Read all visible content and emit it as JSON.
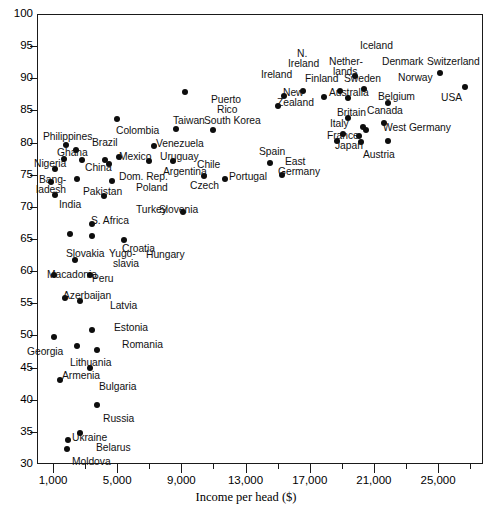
{
  "chart_data": {
    "type": "scatter",
    "title": "",
    "xlabel": "Income per head ($)",
    "ylabel": "",
    "xlim": [
      0,
      27800
    ],
    "ylim": [
      30,
      100
    ],
    "grid": false,
    "legend": "none",
    "x_ticks": [
      "1,000",
      "5,000",
      "9,000",
      "13,000",
      "17,000",
      "21,000",
      "25,000"
    ],
    "x_tick_values": [
      1000,
      5000,
      9000,
      13000,
      17000,
      21000,
      25000
    ],
    "y_ticks": [
      "30",
      "35",
      "40",
      "45",
      "50",
      "55",
      "60",
      "65",
      "70",
      "75",
      "80",
      "85",
      "90",
      "95",
      "100"
    ],
    "y_tick_values": [
      30,
      35,
      40,
      45,
      50,
      55,
      60,
      65,
      70,
      75,
      80,
      85,
      90,
      95,
      100
    ],
    "points": [
      {
        "label": "Moldova",
        "x": 1900,
        "y": 32.4
      },
      {
        "label": "Belarus",
        "x": 2700,
        "y": 34.9
      },
      {
        "label": "Ukraine",
        "x": 1950,
        "y": 33.8
      },
      {
        "label": "Russia",
        "x": 3750,
        "y": 39.2
      },
      {
        "label": "Armenia",
        "x": 1450,
        "y": 43.0
      },
      {
        "label": "Bulgaria",
        "x": 3300,
        "y": 44.9
      },
      {
        "label": "Georgia",
        "x": 1050,
        "y": 49.8
      },
      {
        "label": "Lithuania",
        "x": 2500,
        "y": 48.4
      },
      {
        "label": "Romania",
        "x": 3750,
        "y": 47.8
      },
      {
        "label": "Estonia",
        "x": 3450,
        "y": 50.8
      },
      {
        "label": "Latvia",
        "x": 2700,
        "y": 55.4
      },
      {
        "label": "Azerbaijan",
        "x": 1750,
        "y": 55.9
      },
      {
        "label": "Macadonia",
        "x": 1050,
        "y": 59.4
      },
      {
        "label": "Peru",
        "x": 3300,
        "y": 59.4
      },
      {
        "label": "Yugo-slavia",
        "x": 2350,
        "y": 61.8
      },
      {
        "label": "Slovakia",
        "x": 2050,
        "y": 65.8
      },
      {
        "label": "Croatia",
        "x": 3400,
        "y": 65.4
      },
      {
        "label": "Hungary",
        "x": 5400,
        "y": 64.8
      },
      {
        "label": "S. Africa",
        "x": 3400,
        "y": 67.3
      },
      {
        "label": "Slovenia",
        "x": 9100,
        "y": 69.2
      },
      {
        "label": "Turkey",
        "x": 4200,
        "y": 71.7
      },
      {
        "label": "India",
        "x": 1100,
        "y": 71.8
      },
      {
        "label": "Bang-ladesh",
        "x": 900,
        "y": 73.9
      },
      {
        "label": "Pakistan",
        "x": 2500,
        "y": 74.3
      },
      {
        "label": "Poland",
        "x": 4700,
        "y": 74.0
      },
      {
        "label": "Czech",
        "x": 10400,
        "y": 74.8
      },
      {
        "label": "Portugal",
        "x": 11700,
        "y": 74.4
      },
      {
        "label": "East Germany",
        "x": 15300,
        "y": 74.9
      },
      {
        "label": "Nigeria",
        "x": 1100,
        "y": 75.9
      },
      {
        "label": "China",
        "x": 2800,
        "y": 77.3
      },
      {
        "label": "Dom. Rep.",
        "x": 4500,
        "y": 76.7
      },
      {
        "label": "Mexico",
        "x": 4250,
        "y": 77.3
      },
      {
        "label": "Argentina",
        "x": 7000,
        "y": 77.2
      },
      {
        "label": "Chile",
        "x": 8450,
        "y": 77.1
      },
      {
        "label": "Spain",
        "x": 14500,
        "y": 76.9
      },
      {
        "label": "Ghana",
        "x": 1700,
        "y": 77.4
      },
      {
        "label": "Uruguay",
        "x": 5100,
        "y": 77.8
      },
      {
        "label": "Brazil",
        "x": 2400,
        "y": 78.9
      },
      {
        "label": "Venezuela",
        "x": 7300,
        "y": 79.4
      },
      {
        "label": "Philippines",
        "x": 1800,
        "y": 79.7
      },
      {
        "label": "Italy",
        "x": 18700,
        "y": 80.2
      },
      {
        "label": "Japan",
        "x": 20200,
        "y": 80.1
      },
      {
        "label": "Austria",
        "x": 21900,
        "y": 80.2
      },
      {
        "label": "France",
        "x": 20100,
        "y": 81.1
      },
      {
        "label": "West Germany",
        "x": 20500,
        "y": 81.9
      },
      {
        "label": "Britain",
        "x": 19100,
        "y": 81.3
      },
      {
        "label": "Canada",
        "x": 20300,
        "y": 82.4
      },
      {
        "label": "Taiwan",
        "x": 8650,
        "y": 82.1
      },
      {
        "label": "South Korea",
        "x": 11000,
        "y": 82.0
      },
      {
        "label": "Belgium",
        "x": 21600,
        "y": 83.0
      },
      {
        "label": "Colombia",
        "x": 5000,
        "y": 83.6
      },
      {
        "label": "Australia",
        "x": 19400,
        "y": 83.9
      },
      {
        "label": "Puerto Rico",
        "x": 9200,
        "y": 87.9
      },
      {
        "label": "New Zealand",
        "x": 15000,
        "y": 85.7
      },
      {
        "label": "Norway",
        "x": 21900,
        "y": 86.2
      },
      {
        "label": "Finland",
        "x": 17900,
        "y": 87.1
      },
      {
        "label": "Sweden",
        "x": 19400,
        "y": 87.0
      },
      {
        "label": "Netherlands",
        "x": 18900,
        "y": 88.0
      },
      {
        "label": "Denmark",
        "x": 20400,
        "y": 88.3
      },
      {
        "label": "N. Ireland",
        "x": 16600,
        "y": 88.1
      },
      {
        "label": "Ireland",
        "x": 15400,
        "y": 87.2
      },
      {
        "label": "Iceland",
        "x": 19800,
        "y": 90.3
      },
      {
        "label": "Switzerland",
        "x": 25100,
        "y": 90.9
      },
      {
        "label": "USA",
        "x": 26700,
        "y": 88.7
      }
    ]
  },
  "labels": [
    {
      "name": "label-philippines",
      "text": "Philippines",
      "x": 43,
      "y": 132,
      "align": "l"
    },
    {
      "name": "label-ghana",
      "text": "Ghana",
      "x": 57,
      "y": 148,
      "align": "l"
    },
    {
      "name": "label-nigeria",
      "text": "Nigeria",
      "x": 34,
      "y": 159,
      "align": "l"
    },
    {
      "name": "label-bangladesh-1",
      "text": "Bang-",
      "x": 39,
      "y": 175,
      "align": "l"
    },
    {
      "name": "label-bangladesh-2",
      "text": "ladesh",
      "x": 36,
      "y": 185,
      "align": "l"
    },
    {
      "name": "label-india",
      "text": "India",
      "x": 59,
      "y": 200,
      "align": "l"
    },
    {
      "name": "label-brazil",
      "text": "Brazil",
      "x": 92,
      "y": 138,
      "align": "l"
    },
    {
      "name": "label-china",
      "text": "China",
      "x": 85,
      "y": 163,
      "align": "l"
    },
    {
      "name": "label-pakistan",
      "text": "Pakistan",
      "x": 83,
      "y": 187,
      "align": "l"
    },
    {
      "name": "label-colombia",
      "text": "Colombia",
      "x": 116,
      "y": 126,
      "align": "l"
    },
    {
      "name": "label-mexico",
      "text": "Mexico",
      "x": 119,
      "y": 152,
      "align": "l"
    },
    {
      "name": "label-domrep",
      "text": "Dom. Rep.",
      "x": 119,
      "y": 172,
      "align": "l"
    },
    {
      "name": "label-poland",
      "text": "Poland",
      "x": 136,
      "y": 183,
      "align": "l"
    },
    {
      "name": "label-turkey",
      "text": "Turkey",
      "x": 136,
      "y": 205,
      "align": "l"
    },
    {
      "name": "label-safrica",
      "text": "S. Africa",
      "x": 91,
      "y": 216,
      "align": "l"
    },
    {
      "name": "label-croatia",
      "text": "Croatia",
      "x": 122,
      "y": 244,
      "align": "l"
    },
    {
      "name": "label-slovakia",
      "text": "Slovakia",
      "x": 66,
      "y": 249,
      "align": "l"
    },
    {
      "name": "label-yugo-1",
      "text": "Yugo-",
      "x": 109,
      "y": 249,
      "align": "l"
    },
    {
      "name": "label-yugo-2",
      "text": "slavia",
      "x": 113,
      "y": 259,
      "align": "l"
    },
    {
      "name": "label-hungary",
      "text": "Hungary",
      "x": 146,
      "y": 250,
      "align": "l"
    },
    {
      "name": "label-macadonia",
      "text": "Macadonia",
      "x": 47,
      "y": 270,
      "align": "l"
    },
    {
      "name": "label-peru",
      "text": "Peru",
      "x": 92,
      "y": 274,
      "align": "l"
    },
    {
      "name": "label-azerbaijan",
      "text": "Azerbaijan",
      "x": 63,
      "y": 291,
      "align": "l"
    },
    {
      "name": "label-latvia",
      "text": "Latvia",
      "x": 110,
      "y": 301,
      "align": "l"
    },
    {
      "name": "label-estonia",
      "text": "Estonia",
      "x": 114,
      "y": 323,
      "align": "l"
    },
    {
      "name": "label-georgia",
      "text": "Georgia",
      "x": 27,
      "y": 347,
      "align": "l"
    },
    {
      "name": "label-romania",
      "text": "Romania",
      "x": 122,
      "y": 340,
      "align": "l"
    },
    {
      "name": "label-lithuania",
      "text": "Lithuania",
      "x": 70,
      "y": 358,
      "align": "l"
    },
    {
      "name": "label-armenia",
      "text": "Armenia",
      "x": 62,
      "y": 371,
      "align": "l"
    },
    {
      "name": "label-bulgaria",
      "text": "Bulgaria",
      "x": 99,
      "y": 382,
      "align": "l"
    },
    {
      "name": "label-russia",
      "text": "Russia",
      "x": 103,
      "y": 414,
      "align": "l"
    },
    {
      "name": "label-ukraine",
      "text": "Ukraine",
      "x": 72,
      "y": 433,
      "align": "l"
    },
    {
      "name": "label-belarus",
      "text": "Belarus",
      "x": 96,
      "y": 443,
      "align": "l"
    },
    {
      "name": "label-moldova",
      "text": "Moldova",
      "x": 72,
      "y": 457,
      "align": "l"
    },
    {
      "name": "label-venezuela",
      "text": "Venezuela",
      "x": 156,
      "y": 139,
      "align": "l"
    },
    {
      "name": "label-uruguay",
      "text": "Uruguay",
      "x": 160,
      "y": 152,
      "align": "l"
    },
    {
      "name": "label-argentina",
      "text": "Argentina",
      "x": 163,
      "y": 167,
      "align": "l"
    },
    {
      "name": "label-chile",
      "text": "Chile",
      "x": 197,
      "y": 160,
      "align": "l"
    },
    {
      "name": "label-czech",
      "text": "Czech",
      "x": 190,
      "y": 181,
      "align": "l"
    },
    {
      "name": "label-slovenia",
      "text": "Slovenia",
      "x": 159,
      "y": 205,
      "align": "l"
    },
    {
      "name": "label-taiwan",
      "text": "Taiwan",
      "x": 173,
      "y": 116,
      "align": "l"
    },
    {
      "name": "label-southkorea",
      "text": "South Korea",
      "x": 204,
      "y": 116,
      "align": "l"
    },
    {
      "name": "label-puerto-1",
      "text": "Puerto",
      "x": 211,
      "y": 95,
      "align": "l"
    },
    {
      "name": "label-puerto-2",
      "text": "Rico",
      "x": 217,
      "y": 105,
      "align": "l"
    },
    {
      "name": "label-portugal",
      "text": "Portugal",
      "x": 229,
      "y": 172,
      "align": "l"
    },
    {
      "name": "label-spain",
      "text": "Spain",
      "x": 259,
      "y": 147,
      "align": "l"
    },
    {
      "name": "label-eastger-1",
      "text": "East",
      "x": 285,
      "y": 157,
      "align": "l"
    },
    {
      "name": "label-eastger-2",
      "text": "Germany",
      "x": 278,
      "y": 167,
      "align": "l"
    },
    {
      "name": "label-newzeal-1",
      "text": "New",
      "x": 283,
      "y": 88,
      "align": "l"
    },
    {
      "name": "label-newzeal-2",
      "text": "Zealand",
      "x": 277,
      "y": 98,
      "align": "l"
    },
    {
      "name": "label-ireland",
      "text": "Ireland",
      "x": 261,
      "y": 70,
      "align": "l"
    },
    {
      "name": "label-nireland-1",
      "text": "N.",
      "x": 297,
      "y": 49,
      "align": "l"
    },
    {
      "name": "label-nireland-2",
      "text": "Ireland",
      "x": 288,
      "y": 59,
      "align": "l"
    },
    {
      "name": "label-finland",
      "text": "Finland",
      "x": 305,
      "y": 74,
      "align": "l"
    },
    {
      "name": "label-nether-1",
      "text": "Nether-",
      "x": 329,
      "y": 57,
      "align": "l"
    },
    {
      "name": "label-nether-2",
      "text": "lands",
      "x": 333,
      "y": 67,
      "align": "l"
    },
    {
      "name": "label-sweden",
      "text": "Sweden",
      "x": 344,
      "y": 74,
      "align": "l"
    },
    {
      "name": "label-iceland",
      "text": "Iceland",
      "x": 360,
      "y": 41,
      "align": "l"
    },
    {
      "name": "label-australia",
      "text": "Australia",
      "x": 329,
      "y": 88,
      "align": "l"
    },
    {
      "name": "label-denmark",
      "text": "Denmark",
      "x": 382,
      "y": 57,
      "align": "l"
    },
    {
      "name": "label-norway",
      "text": "Norway",
      "x": 398,
      "y": 73,
      "align": "l"
    },
    {
      "name": "label-belgium",
      "text": "Belgium",
      "x": 378,
      "y": 92,
      "align": "l"
    },
    {
      "name": "label-canada",
      "text": "Canada",
      "x": 367,
      "y": 106,
      "align": "l"
    },
    {
      "name": "label-britain",
      "text": "Britain",
      "x": 337,
      "y": 108,
      "align": "l"
    },
    {
      "name": "label-italy",
      "text": "Italy",
      "x": 330,
      "y": 119,
      "align": "l"
    },
    {
      "name": "label-france",
      "text": "France",
      "x": 327,
      "y": 131,
      "align": "l"
    },
    {
      "name": "label-westgermany",
      "text": "West Germany",
      "x": 383,
      "y": 123,
      "align": "l"
    },
    {
      "name": "label-japan",
      "text": "Japan",
      "x": 335,
      "y": 141,
      "align": "l"
    },
    {
      "name": "label-austria",
      "text": "Austria",
      "x": 363,
      "y": 150,
      "align": "l"
    },
    {
      "name": "label-switzerland",
      "text": "Switzerland",
      "x": 427,
      "y": 57,
      "align": "l"
    },
    {
      "name": "label-usa",
      "text": "USA",
      "x": 441,
      "y": 93,
      "align": "l"
    }
  ]
}
